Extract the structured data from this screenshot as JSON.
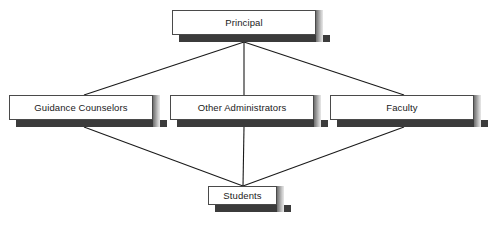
{
  "diagram": {
    "type": "organizational-hierarchy",
    "title": "",
    "background_color": "#ffffff",
    "box_fill_color": "#ffffff",
    "box_border_color": "#4a4a4a",
    "box_shadow_color": "#3b3b3b",
    "connector_color": "#1a1a1a",
    "levels": [
      {
        "level": 1,
        "nodes": [
          {
            "id": "principal",
            "label": "Principal",
            "x": 172,
            "y": 10,
            "width": 151,
            "height": 32
          }
        ]
      },
      {
        "level": 2,
        "nodes": [
          {
            "id": "guidance",
            "label": "Guidance Counselors",
            "x": 9,
            "y": 95,
            "width": 151,
            "height": 32
          },
          {
            "id": "other_admin",
            "label": "Other Administrators",
            "x": 170,
            "y": 95,
            "width": 151,
            "height": 32
          },
          {
            "id": "faculty",
            "label": "Faculty",
            "x": 330,
            "y": 95,
            "width": 151,
            "height": 32
          }
        ]
      },
      {
        "level": 3,
        "nodes": [
          {
            "id": "students",
            "label": "Students",
            "x": 208,
            "y": 186,
            "width": 76,
            "height": 26
          }
        ]
      }
    ],
    "connectors": [
      {
        "from": "principal",
        "to": "guidance",
        "x1": 244,
        "y1": 42,
        "x2": 84,
        "y2": 95
      },
      {
        "from": "principal",
        "to": "other_admin",
        "x1": 244,
        "y1": 42,
        "x2": 244,
        "y2": 95
      },
      {
        "from": "principal",
        "to": "faculty",
        "x1": 244,
        "y1": 42,
        "x2": 404,
        "y2": 95
      },
      {
        "from": "guidance",
        "to": "students",
        "x1": 84,
        "y1": 127,
        "x2": 243,
        "y2": 186
      },
      {
        "from": "other_admin",
        "to": "students",
        "x1": 244,
        "y1": 127,
        "x2": 243,
        "y2": 186
      },
      {
        "from": "faculty",
        "to": "students",
        "x1": 404,
        "y1": 127,
        "x2": 243,
        "y2": 186
      }
    ]
  }
}
